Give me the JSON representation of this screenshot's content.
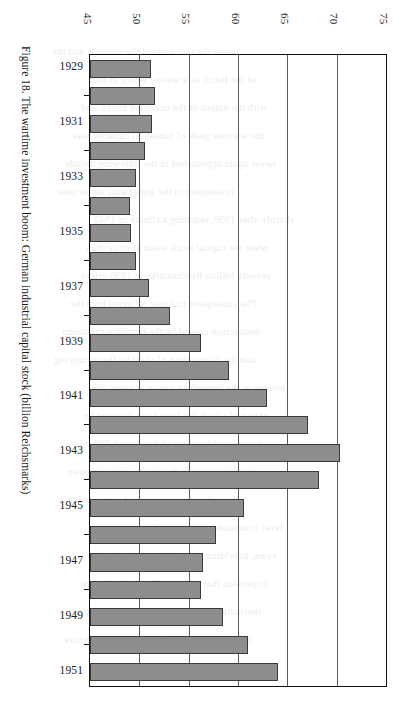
{
  "caption": "Figure 18. The wartime investment boom: German industrial capital stock (billion Reichsmarks)",
  "axis": {
    "x_ticks": [
      "45",
      "50",
      "55",
      "60",
      "65",
      "70",
      "75"
    ],
    "y_labels": [
      "1929",
      "1931",
      "1933",
      "1935",
      "1937",
      "1939",
      "1941",
      "1943",
      "1945",
      "1947",
      "1949",
      "1951"
    ]
  },
  "colors": {
    "bar_fill": "#8d8d8d",
    "bar_stroke": "#3a3a3a",
    "axis": "#111111",
    "grid": "#5a5a5a",
    "page": "#ffffff"
  },
  "chart_data": {
    "type": "bar",
    "orientation": "horizontal",
    "title": "Figure 18. The wartime investment boom: German industrial capital stock (billion Reichsmarks)",
    "xlabel": "",
    "ylabel": "",
    "unit": "billion Reichsmarks",
    "xlim": [
      45,
      75
    ],
    "xticks": [
      45,
      50,
      55,
      60,
      65,
      70,
      75
    ],
    "grid": true,
    "legend": false,
    "categories": [
      "1929",
      "1930",
      "1931",
      "1932",
      "1933",
      "1934",
      "1935",
      "1936",
      "1937",
      "1938",
      "1939",
      "1940",
      "1941",
      "1942",
      "1943",
      "1944",
      "1945",
      "1946",
      "1947",
      "1948",
      "1949",
      "1950",
      "1951"
    ],
    "labelled_categories": [
      "1929",
      "1931",
      "1933",
      "1935",
      "1937",
      "1939",
      "1941",
      "1943",
      "1945",
      "1947",
      "1949",
      "1951"
    ],
    "values": [
      51.2,
      51.6,
      51.3,
      50.6,
      49.7,
      49.1,
      49.2,
      49.7,
      51.0,
      53.1,
      56.2,
      59.1,
      62.9,
      67.1,
      70.3,
      68.2,
      60.6,
      57.8,
      56.5,
      56.3,
      58.5,
      61.0,
      64.1
    ]
  },
  "bleed_text": [
    "tween the two parts of the country, and the",
    "of the Reich as a whole, which in turn",
    "with the output of the occupied zones, and",
    "the wartime peak of industrial capacity was",
    "never again approached in the following decade",
    "investment in the armaments sector rose",
    "sharply after 1936, reaching a climax in 1943",
    "when the capital stock stood at more than",
    "seventy billion Reichsmarks in 1936 prices.",
    "The subsequent collapse reflected both the",
    "destruction caused by the bombing campaign",
    "and the dismantling of plant by the occupying",
    "powers in the immediate post-war years, the",
    "extent of which has long been disputed by",
    "economic historians of the period. What is",
    "clear, however, is that by the early nineteen",
    "fifties the capital stock had recovered to a",
    "level comparable with that of the later war",
    "years, providing a broad foundation for the",
    "expansion that was to follow in the decade",
    "thereafter, and that the figures presented in",
    "the table below confirm the general picture"
  ]
}
